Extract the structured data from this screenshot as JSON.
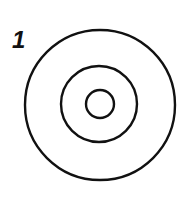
{
  "figure": {
    "label": "1",
    "stroke_color": "#111111",
    "background": "#ffffff",
    "circles": [
      {
        "name": "outer",
        "cx": 100,
        "cy": 105,
        "r": 75
      },
      {
        "name": "middle",
        "cx": 99,
        "cy": 104,
        "r": 38
      },
      {
        "name": "inner",
        "cx": 100,
        "cy": 104,
        "r": 14
      }
    ]
  }
}
